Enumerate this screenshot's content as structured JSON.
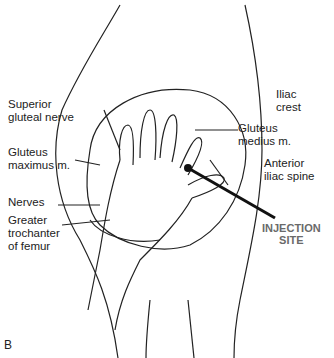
{
  "figure": {
    "panel_letter": "B",
    "labels": {
      "iliac_crest": "Iliac\ncrest",
      "superior_gluteal_nerve": "Superior\ngluteal nerve",
      "gluteus_medius": "Gluteus\nmedius m.",
      "gluteus_maximus": "Gluteus\nmaximus m.",
      "anterior_iliac_spine": "Anterior\niliac spine",
      "nerves": "Nerves",
      "greater_trochanter": "Greater\ntrochanter\nof femur",
      "injection_site": "INJECTION\nSITE"
    },
    "colors": {
      "line": "#222222",
      "injection_label": "#6a6a6a"
    }
  }
}
